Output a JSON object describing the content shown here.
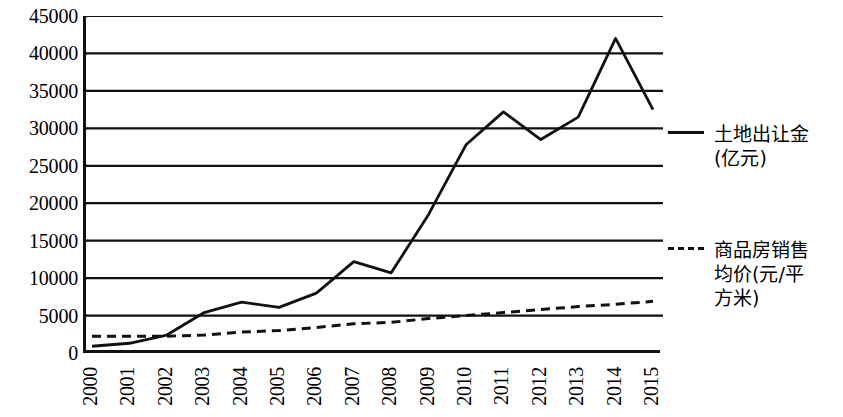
{
  "chart_data": {
    "type": "line",
    "title": "",
    "xlabel": "",
    "ylabel": "",
    "ylim": [
      0,
      45000
    ],
    "yticks": [
      0,
      5000,
      10000,
      15000,
      20000,
      25000,
      30000,
      35000,
      40000,
      45000
    ],
    "ytick_labels": [
      "0",
      "5000",
      "10000",
      "15000",
      "20000",
      "25000",
      "30000",
      "35000",
      "40000",
      "45000"
    ],
    "grid": "horizontal",
    "legend_position": "right",
    "categories": [
      "2000",
      "2001",
      "2002",
      "2003",
      "2004",
      "2005",
      "2006",
      "2007",
      "2008",
      "2009",
      "2010",
      "2011",
      "2012",
      "2013",
      "2014",
      "2015"
    ],
    "series": [
      {
        "name": "土地出让金(亿元)",
        "style": "solid",
        "color": "#111111",
        "values": [
          900,
          1300,
          2400,
          5400,
          6800,
          6100,
          8000,
          12200,
          10700,
          18500,
          27800,
          32200,
          28500,
          31500,
          42000,
          32500
        ]
      },
      {
        "name": "商品房销售均价(元/平方米)",
        "style": "dashed",
        "color": "#111111",
        "values": [
          2250,
          2250,
          2250,
          2400,
          2800,
          3000,
          3400,
          3900,
          4100,
          4600,
          5000,
          5400,
          5800,
          6200,
          6500,
          6900
        ]
      }
    ]
  },
  "legend": {
    "entries": [
      {
        "label": "土地出让金\n(亿元)",
        "style": "solid"
      },
      {
        "label": "商品房销售\n均价(元/平\n方米)",
        "style": "dashed"
      }
    ],
    "land_label_line1": "土地出让金",
    "land_label_line2": "(亿元)",
    "price_label_line1": "商品房销售",
    "price_label_line2": "均价(元/平",
    "price_label_line3": "方米)"
  },
  "axis": {
    "y_max_label": "45000",
    "y_min_label": "0"
  }
}
